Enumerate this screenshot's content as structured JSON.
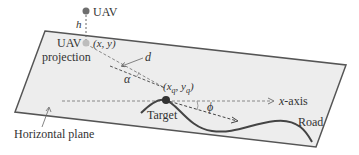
{
  "diagram": {
    "labels": {
      "uav": "UAV",
      "h": "h",
      "uav_projection_line1": "UAV",
      "uav_projection_line2": "projection",
      "uav_coords": "(x, y)",
      "d": "d",
      "alpha": "α",
      "target_coords_open": "(x",
      "target_coords_q1": "q",
      "target_coords_mid": ", y",
      "target_coords_q2": "q",
      "target_coords_close": ")",
      "x_axis_var": "x",
      "x_axis_suffix": "-axis",
      "phi": "ϕ",
      "target": "Target",
      "road": "Road",
      "horizontal_plane": "Horizontal plane"
    },
    "colors": {
      "plane_fill": "#ededed",
      "plane_edge": "#555555",
      "uav_dot": "#6e6e6e",
      "projection_dot": "#bdbdbd",
      "target_dot": "#333333",
      "road": "#444444",
      "dashed": "#666666",
      "text": "#333333"
    }
  }
}
